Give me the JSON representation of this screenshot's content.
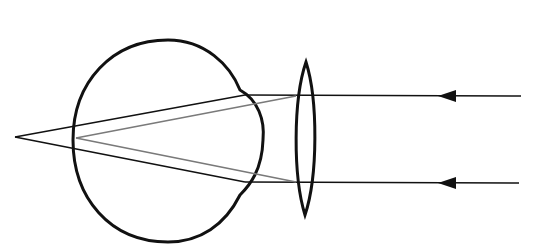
{
  "diagram": {
    "title": "",
    "colors": {
      "background": "#ffffff",
      "stroke": "#111111",
      "corrected_ray": "#7a7a7a"
    },
    "elements": {
      "eyeball": "eyeball",
      "corrective_lens": "converging-lens",
      "incoming_rays": 2,
      "uncorrected_focus": "behind-retina",
      "corrected_focus": "on-retina"
    }
  }
}
